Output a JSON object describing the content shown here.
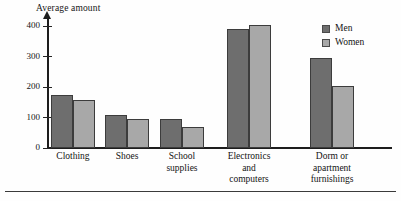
{
  "chart_data": {
    "type": "bar",
    "title": "",
    "ylabel": "Average amount",
    "xlabel": "",
    "ylim": [
      0,
      430
    ],
    "yticks": [
      0,
      100,
      200,
      300,
      400
    ],
    "ytick_labels": [
      "0",
      "100",
      "200",
      "300",
      "400"
    ],
    "grid": false,
    "legend_position": "top-right",
    "categories": [
      "Clothing",
      "Shoes",
      "School\nsupplies",
      "Electronics\nand\ncomputers",
      "Dorm or\napartment\nfurnishings"
    ],
    "series": [
      {
        "name": "Men",
        "color": "#6e6e6e",
        "values": [
          175,
          110,
          95,
          390,
          295
        ]
      },
      {
        "name": "Women",
        "color": "#a8a8a8",
        "values": [
          158,
          95,
          70,
          405,
          205
        ]
      }
    ]
  },
  "legend": {
    "items": [
      {
        "label": "Men"
      },
      {
        "label": "Women"
      }
    ]
  }
}
